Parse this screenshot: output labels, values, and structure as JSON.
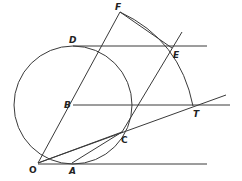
{
  "diagram": {
    "type": "geometric-construction",
    "stroke_color": "#3a3a3a",
    "labels": {
      "O": "O",
      "A": "A",
      "B": "B",
      "C": "C",
      "D": "D",
      "E": "E",
      "F": "F",
      "T": "T"
    },
    "points": {
      "O": [
        38,
        163
      ],
      "A": [
        72,
        163
      ],
      "B": [
        73,
        105
      ],
      "C": [
        122,
        132
      ],
      "D": [
        73,
        46
      ],
      "E": [
        172,
        48
      ],
      "F": [
        120,
        12
      ],
      "T": [
        193,
        106
      ]
    },
    "circle": {
      "center": "B",
      "radius": 59
    }
  }
}
